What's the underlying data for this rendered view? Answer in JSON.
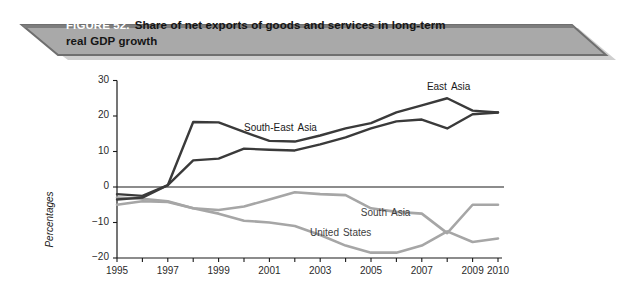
{
  "banner": {
    "figure_number": "FIGURE 52.",
    "title_line1": "Share of net exports of goods and services in long-term",
    "title_line2": "real GDP growth",
    "fill_color": "#a9a9a9",
    "edge_color": "#6f6f6f",
    "figure_number_color": "#ffffff",
    "title_color": "#151515"
  },
  "chart_data": {
    "type": "line",
    "title": "Share of net exports of goods and services in long-term real GDP growth",
    "xlabel": "",
    "ylabel": "Percentages",
    "grid": false,
    "legend_position": "inline-annotations",
    "xlim": [
      1995,
      2010
    ],
    "ylim": [
      -20,
      30
    ],
    "ytick_labels": [
      "30",
      "20",
      "10",
      "0",
      "−10",
      "−20"
    ],
    "ytick_values": [
      30,
      20,
      10,
      0,
      -10,
      -20
    ],
    "xtick_labels": [
      "1995",
      "1997",
      "1999",
      "2001",
      "2003",
      "2005",
      "2007",
      "2009",
      "2010"
    ],
    "xtick_values": [
      1995,
      1997,
      1999,
      2001,
      2003,
      2005,
      2007,
      2009,
      2010
    ],
    "x": [
      1995,
      1996,
      1997,
      1998,
      1999,
      2000,
      2001,
      2002,
      2003,
      2004,
      2005,
      2006,
      2007,
      2008,
      2009,
      2010
    ],
    "series": [
      {
        "name": "East Asia",
        "color": "#3a3a3a",
        "values": [
          -2.0,
          -2.5,
          0.5,
          18.3,
          18.2,
          15.5,
          13.0,
          12.8,
          14.5,
          16.5,
          18.0,
          21.0,
          23.0,
          25.0,
          21.5,
          21.0
        ],
        "label_x": 2007.2,
        "label_y": 28.0
      },
      {
        "name": "South-East Asia",
        "color": "#3a3a3a",
        "values": [
          -3.5,
          -3.0,
          0.5,
          7.5,
          8.0,
          10.8,
          10.5,
          10.3,
          12.0,
          14.0,
          16.5,
          18.5,
          19.0,
          16.5,
          20.5,
          21.0
        ],
        "label_x": 2000.0,
        "label_y": 16.2
      },
      {
        "name": "South Asia",
        "color": "#a6a6a6",
        "values": [
          -3.0,
          -3.3,
          -4.0,
          -6.0,
          -6.5,
          -5.5,
          -3.5,
          -1.5,
          -2.0,
          -2.3,
          -6.0,
          -7.0,
          -7.5,
          -13.0,
          -5.0,
          -5.0
        ],
        "label_x": 2004.6,
        "label_y": -7.6
      },
      {
        "name": "United States",
        "color": "#a6a6a6",
        "values": [
          -5.0,
          -4.0,
          -4.2,
          -6.0,
          -7.5,
          -9.5,
          -10.0,
          -11.0,
          -13.5,
          -16.5,
          -18.5,
          -18.5,
          -16.5,
          -12.5,
          -15.5,
          -14.5
        ],
        "label_x": 2002.6,
        "label_y": -13.2
      }
    ],
    "axis_color": "#1a1a1a",
    "zero_line": 0
  }
}
